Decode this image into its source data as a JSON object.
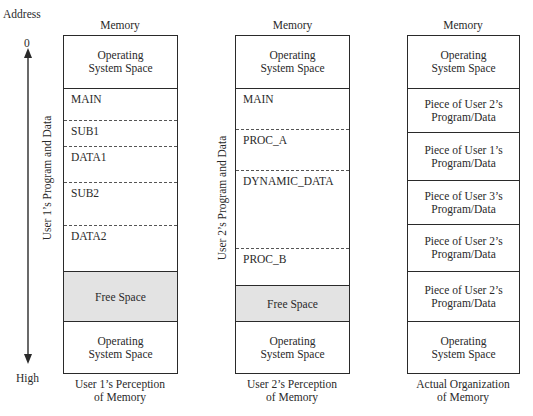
{
  "axis": {
    "title": "Address",
    "top_label": "0",
    "bottom_label": "High"
  },
  "columns": [
    {
      "header": "Memory",
      "caption_line1": "User 1’s Perception",
      "caption_line2": "of Memory",
      "side_label": "User 1’s Program and Data",
      "segments": [
        {
          "label": "Operating System Space",
          "lines": [
            "Operating",
            "System Space"
          ],
          "kind": "os"
        },
        {
          "label": "MAIN",
          "kind": "program"
        },
        {
          "label": "SUB1",
          "kind": "program"
        },
        {
          "label": "DATA1",
          "kind": "program"
        },
        {
          "label": "SUB2",
          "kind": "program"
        },
        {
          "label": "DATA2",
          "kind": "program"
        },
        {
          "label": "Free Space",
          "kind": "free"
        },
        {
          "label": "Operating System Space",
          "lines": [
            "Operating",
            "System Space"
          ],
          "kind": "os"
        }
      ]
    },
    {
      "header": "Memory",
      "caption_line1": "User 2’s Perception",
      "caption_line2": "of Memory",
      "side_label": "User 2’s Program and Data",
      "segments": [
        {
          "label": "Operating System Space",
          "lines": [
            "Operating",
            "System Space"
          ],
          "kind": "os"
        },
        {
          "label": "MAIN",
          "kind": "program"
        },
        {
          "label": "PROC_A",
          "kind": "program"
        },
        {
          "label": "DYNAMIC_DATA",
          "kind": "program"
        },
        {
          "label": "PROC_B",
          "kind": "program"
        },
        {
          "label": "Free Space",
          "kind": "free"
        },
        {
          "label": "Operating System Space",
          "lines": [
            "Operating",
            "System Space"
          ],
          "kind": "os"
        }
      ]
    },
    {
      "header": "Memory",
      "caption_line1": "Actual Organization",
      "caption_line2": "of Memory",
      "segments": [
        {
          "label": "Operating System Space",
          "lines": [
            "Operating",
            "System Space"
          ],
          "kind": "os"
        },
        {
          "label": "Piece of User 2’s Program/Data",
          "lines": [
            "Piece of User 2’s",
            "Program/Data"
          ],
          "kind": "piece"
        },
        {
          "label": "Piece of User 1’s Program/Data",
          "lines": [
            "Piece of User 1’s",
            "Program/Data"
          ],
          "kind": "piece"
        },
        {
          "label": "Piece of User 3’s Program/Data",
          "lines": [
            "Piece of User 3’s",
            "Program/Data"
          ],
          "kind": "piece"
        },
        {
          "label": "Piece of User 2’s Program/Data",
          "lines": [
            "Piece of User 2’s",
            "Program/Data"
          ],
          "kind": "piece"
        },
        {
          "label": "Piece of User 2’s Program/Data",
          "lines": [
            "Piece of User 2’s",
            "Program/Data"
          ],
          "kind": "piece"
        },
        {
          "label": "Operating System Space",
          "lines": [
            "Operating",
            "System Space"
          ],
          "kind": "os"
        }
      ]
    }
  ]
}
